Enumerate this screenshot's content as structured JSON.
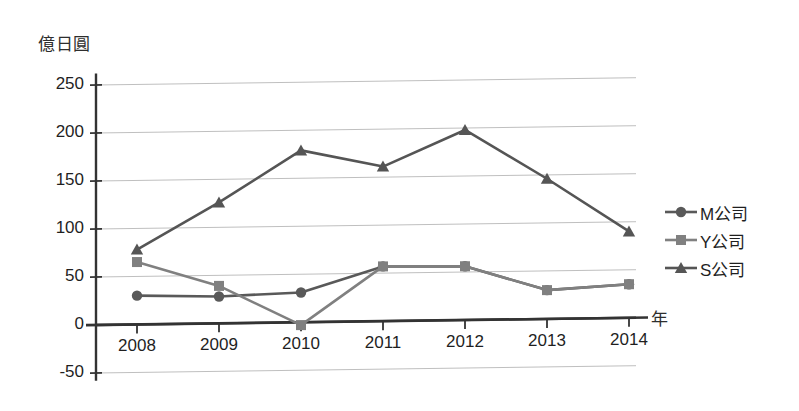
{
  "chart_data": {
    "type": "line",
    "title": "",
    "subtitle": "",
    "xlabel": "年",
    "ylabel": "億日圓",
    "categories": [
      "2008",
      "2009",
      "2010",
      "2011",
      "2012",
      "2013",
      "2014"
    ],
    "ylim": [
      -50,
      250
    ],
    "ytick_labels": [
      "250",
      "200",
      "150",
      "100",
      "50",
      "0",
      "-50"
    ],
    "ytick_values": [
      250,
      200,
      150,
      100,
      50,
      0,
      -50
    ],
    "ytick_step": 50,
    "grid": true,
    "grid_axis": "y",
    "legend_position": "right",
    "series": [
      {
        "name": "M公司",
        "marker": "circle",
        "color": "#595959",
        "values": [
          30,
          28,
          31,
          57,
          56,
          30,
          35
        ]
      },
      {
        "name": "Y公司",
        "marker": "square",
        "color": "#808080",
        "values": [
          65,
          39,
          -3,
          57,
          56,
          30,
          35
        ]
      },
      {
        "name": "S公司",
        "marker": "triangle",
        "color": "#555555",
        "values": [
          78,
          126,
          179,
          161,
          198,
          146,
          90
        ]
      }
    ]
  },
  "legend": {
    "items": [
      {
        "label": "M公司",
        "marker": "circle",
        "color": "#595959"
      },
      {
        "label": "Y公司",
        "marker": "square",
        "color": "#808080"
      },
      {
        "label": "S公司",
        "marker": "triangle",
        "color": "#555555"
      }
    ]
  },
  "axes": {
    "y_unit": "億日圓",
    "x_unit": "年",
    "y_ticks": [
      "250",
      "200",
      "150",
      "100",
      "50",
      "0",
      "-50"
    ],
    "x_ticks": [
      "2008",
      "2009",
      "2010",
      "2011",
      "2012",
      "2013",
      "2014"
    ]
  },
  "colors": {
    "axis": "#333333",
    "grid": "#bfbfbf",
    "text": "#1f1f1f",
    "series_m": "#595959",
    "series_y": "#808080",
    "series_s": "#555555"
  }
}
